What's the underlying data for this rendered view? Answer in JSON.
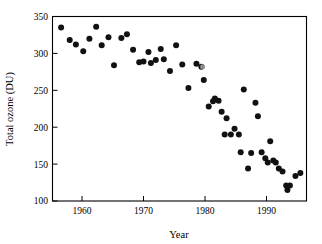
{
  "chart_data": {
    "type": "scatter",
    "title": "",
    "xlabel": "Year",
    "ylabel": "Total ozone (DU)",
    "xlim": [
      1955.2,
      1996.5
    ],
    "ylim": [
      100,
      350
    ],
    "grid": false,
    "legend": "none",
    "xticks": [
      1960,
      1970,
      1980,
      1990
    ],
    "xtick_labels": [
      "1960",
      "1970",
      "1980",
      "1990"
    ],
    "yticks": [
      100,
      150,
      200,
      250,
      300,
      350
    ],
    "ytick_labels": [
      "100",
      "150",
      "200",
      "250",
      "300",
      "350"
    ],
    "marker": "filled-circle",
    "marker_color": "#111111",
    "series": [
      {
        "name": "Total ozone",
        "points": [
          {
            "x": 1956.6,
            "y": 335
          },
          {
            "x": 1958.0,
            "y": 318
          },
          {
            "x": 1959.0,
            "y": 312
          },
          {
            "x": 1960.2,
            "y": 303
          },
          {
            "x": 1961.2,
            "y": 320
          },
          {
            "x": 1962.3,
            "y": 336
          },
          {
            "x": 1963.2,
            "y": 311
          },
          {
            "x": 1964.3,
            "y": 322
          },
          {
            "x": 1965.2,
            "y": 284
          },
          {
            "x": 1966.4,
            "y": 321
          },
          {
            "x": 1967.3,
            "y": 326
          },
          {
            "x": 1968.3,
            "y": 305
          },
          {
            "x": 1969.3,
            "y": 288
          },
          {
            "x": 1970.0,
            "y": 289
          },
          {
            "x": 1970.8,
            "y": 302
          },
          {
            "x": 1971.2,
            "y": 287
          },
          {
            "x": 1972.0,
            "y": 291
          },
          {
            "x": 1972.8,
            "y": 306
          },
          {
            "x": 1973.3,
            "y": 292
          },
          {
            "x": 1974.3,
            "y": 276
          },
          {
            "x": 1975.3,
            "y": 311
          },
          {
            "x": 1976.3,
            "y": 285
          },
          {
            "x": 1977.3,
            "y": 253
          },
          {
            "x": 1978.6,
            "y": 286
          },
          {
            "x": 1979.4,
            "y": 282
          },
          {
            "x": 1979.8,
            "y": 264
          },
          {
            "x": 1980.6,
            "y": 228
          },
          {
            "x": 1981.3,
            "y": 235
          },
          {
            "x": 1981.6,
            "y": 239
          },
          {
            "x": 1982.2,
            "y": 236
          },
          {
            "x": 1982.7,
            "y": 221
          },
          {
            "x": 1983.2,
            "y": 190
          },
          {
            "x": 1983.5,
            "y": 212
          },
          {
            "x": 1984.2,
            "y": 190
          },
          {
            "x": 1984.8,
            "y": 198
          },
          {
            "x": 1985.5,
            "y": 190
          },
          {
            "x": 1985.8,
            "y": 166
          },
          {
            "x": 1986.3,
            "y": 251
          },
          {
            "x": 1987.0,
            "y": 144
          },
          {
            "x": 1987.5,
            "y": 165
          },
          {
            "x": 1988.2,
            "y": 233
          },
          {
            "x": 1988.6,
            "y": 215
          },
          {
            "x": 1989.2,
            "y": 166
          },
          {
            "x": 1989.8,
            "y": 158
          },
          {
            "x": 1990.2,
            "y": 152
          },
          {
            "x": 1990.6,
            "y": 181
          },
          {
            "x": 1991.1,
            "y": 155
          },
          {
            "x": 1991.5,
            "y": 152
          },
          {
            "x": 1992.0,
            "y": 144
          },
          {
            "x": 1992.6,
            "y": 140
          },
          {
            "x": 1993.2,
            "y": 121
          },
          {
            "x": 1993.4,
            "y": 115
          },
          {
            "x": 1993.8,
            "y": 121
          },
          {
            "x": 1994.7,
            "y": 134
          },
          {
            "x": 1995.5,
            "y": 138
          },
          {
            "x": 1979.6,
            "y": 282,
            "style": "open"
          }
        ]
      }
    ]
  }
}
